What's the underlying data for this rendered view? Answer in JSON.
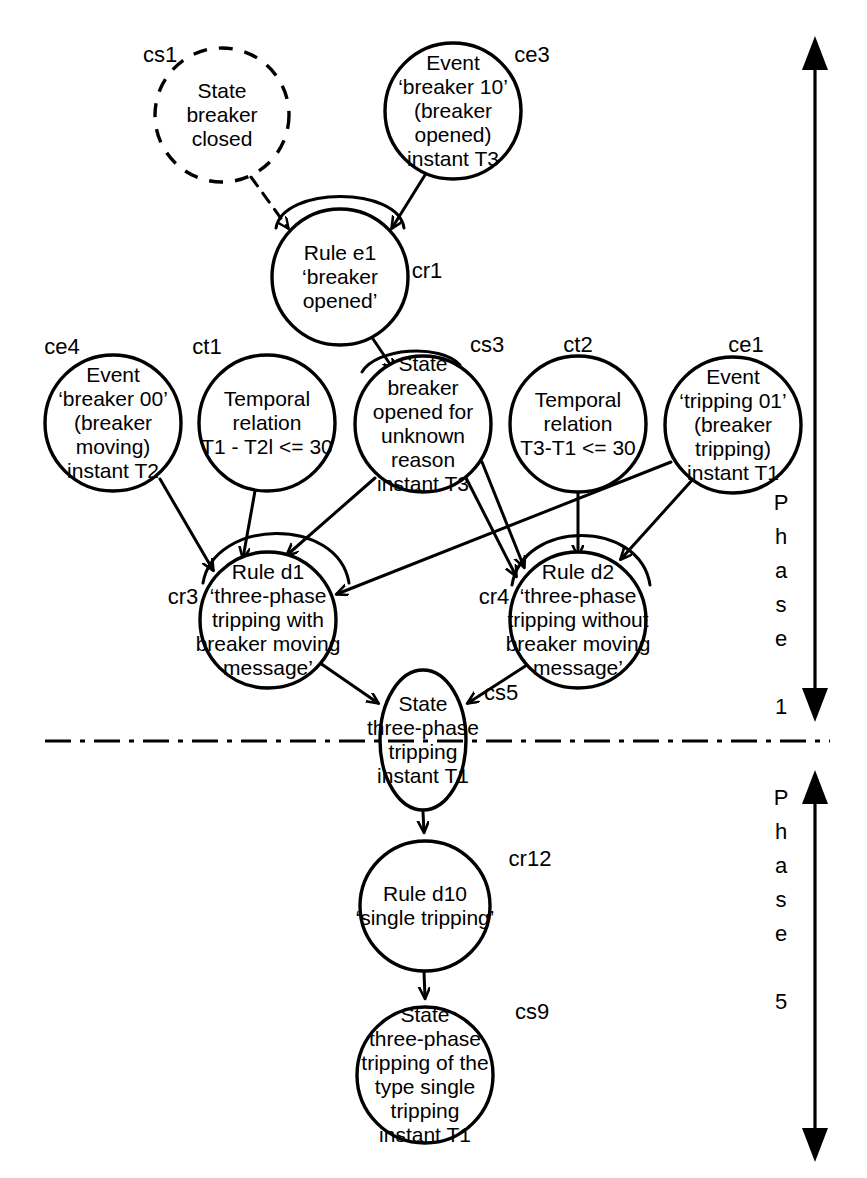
{
  "diagram": {
    "stroke_color": "#000000",
    "fill_color": "#ffffff",
    "background": "#ffffff",
    "nodes": [
      {
        "id": "cs1",
        "tag": "cs1",
        "kind": "state",
        "style": "dashed",
        "cx": 222,
        "cy": 115,
        "r": 67,
        "lines": [
          "State",
          "breaker",
          "closed"
        ]
      },
      {
        "id": "ce3",
        "tag": "ce3",
        "kind": "event",
        "style": "solid",
        "cx": 453,
        "cy": 111,
        "r": 68,
        "lines": [
          "Event",
          "‘breaker 10’",
          "(breaker",
          "opened)",
          "instant T3"
        ]
      },
      {
        "id": "cr1",
        "tag": "cr1",
        "kind": "rule",
        "style": "solid",
        "cx": 340,
        "cy": 277,
        "r": 68,
        "lines": [
          "Rule e1",
          "‘breaker",
          "opened’"
        ]
      },
      {
        "id": "ce4",
        "tag": "ce4",
        "kind": "event",
        "style": "solid",
        "cx": 113,
        "cy": 423,
        "r": 68,
        "lines": [
          "Event",
          "‘breaker 00’",
          "(breaker",
          "moving)",
          "instant T2"
        ]
      },
      {
        "id": "ct1",
        "tag": "ct1",
        "kind": "temporal",
        "style": "solid",
        "cx": 267,
        "cy": 423,
        "r": 68,
        "lines": [
          "Temporal",
          "relation",
          "T1 - T2l <= 30"
        ]
      },
      {
        "id": "cs3",
        "tag": "cs3",
        "kind": "state",
        "style": "solid",
        "cx": 423,
        "cy": 424,
        "r": 68,
        "lines": [
          "State",
          "breaker",
          "opened for",
          "unknown",
          "reason",
          "instant T3"
        ]
      },
      {
        "id": "ct2",
        "tag": "ct2",
        "kind": "temporal",
        "style": "solid",
        "cx": 578,
        "cy": 424,
        "r": 68,
        "lines": [
          "Temporal",
          "relation",
          "T3-T1 <= 30"
        ]
      },
      {
        "id": "ce1",
        "tag": "ce1",
        "kind": "event",
        "style": "solid",
        "cx": 733,
        "cy": 425,
        "r": 68,
        "lines": [
          "Event",
          "‘tripping 01’",
          "(breaker",
          "tripping)",
          "instant T1"
        ]
      },
      {
        "id": "cr3",
        "tag": "cr3",
        "kind": "rule",
        "style": "solid",
        "cx": 268,
        "cy": 620,
        "r": 68,
        "lines": [
          "Rule d1",
          "‘three-phase",
          "tripping with",
          "breaker moving",
          "message’"
        ]
      },
      {
        "id": "cr4",
        "tag": "cr4",
        "kind": "rule",
        "style": "solid",
        "cx": 578,
        "cy": 620,
        "r": 68,
        "lines": [
          "Rule d2",
          "‘three-phase",
          "tripping without",
          "breaker moving",
          "message’"
        ]
      },
      {
        "id": "cs5",
        "tag": "cs5",
        "kind": "state",
        "style": "solid",
        "cx": 423,
        "cy": 740,
        "rx": 43,
        "ry": 70,
        "lines": [
          "State",
          "three-phase",
          "tripping",
          "instant T1"
        ]
      },
      {
        "id": "cr12",
        "tag": "cr12",
        "kind": "rule",
        "style": "solid",
        "cx": 425,
        "cy": 906,
        "r": 65,
        "lines": [
          "Rule d10",
          "‘single tripping’"
        ]
      },
      {
        "id": "cs9",
        "tag": "cs9",
        "kind": "state",
        "style": "solid",
        "cx": 425,
        "cy": 1075,
        "r": 68,
        "lines": [
          "State",
          "three-phase",
          "tripping of the",
          "type single",
          "tripping",
          "instant T1"
        ]
      }
    ],
    "edges": [
      {
        "from": "cs1",
        "to": "cr1",
        "style": "dashed"
      },
      {
        "from": "ce3",
        "to": "cr1",
        "style": "solid"
      },
      {
        "from": "cr1",
        "to": "cs3",
        "style": "solid"
      },
      {
        "from": "ce4",
        "to": "cr3",
        "style": "solid"
      },
      {
        "from": "ct1",
        "to": "cr3",
        "style": "solid"
      },
      {
        "from": "cs3",
        "to": "cr3",
        "style": "solid"
      },
      {
        "from": "ce1",
        "to": "cr3",
        "style": "solid"
      },
      {
        "from": "cs3",
        "to": "cr4",
        "style": "solid"
      },
      {
        "from": "ct2",
        "to": "cr4",
        "style": "solid"
      },
      {
        "from": "ce1",
        "to": "cr4",
        "style": "solid"
      },
      {
        "from": "cr3",
        "to": "cs5",
        "style": "solid"
      },
      {
        "from": "cr4",
        "to": "cs5",
        "style": "solid"
      },
      {
        "from": "cs5",
        "to": "cr12",
        "style": "solid"
      },
      {
        "from": "cr12",
        "to": "cs9",
        "style": "solid"
      }
    ],
    "separator": {
      "name": "phase-divider",
      "style": "dash-dot",
      "y": 741,
      "x1": 45,
      "x2": 830
    },
    "phase_markers": [
      {
        "id": "phase1",
        "label": "Phase 1",
        "letters": [
          "P",
          "h",
          "a",
          "s",
          "e",
          "",
          "1"
        ],
        "x": 815,
        "y_top": 40,
        "y_bottom": 718,
        "label_x": 781,
        "label_y_start": 510
      },
      {
        "id": "phase5",
        "label": "Phase 5",
        "letters": [
          "P",
          "h",
          "a",
          "s",
          "e",
          "",
          "5"
        ],
        "x": 815,
        "y_top": 770,
        "y_bottom": 1160,
        "label_x": 781,
        "label_y_start": 805
      }
    ]
  }
}
